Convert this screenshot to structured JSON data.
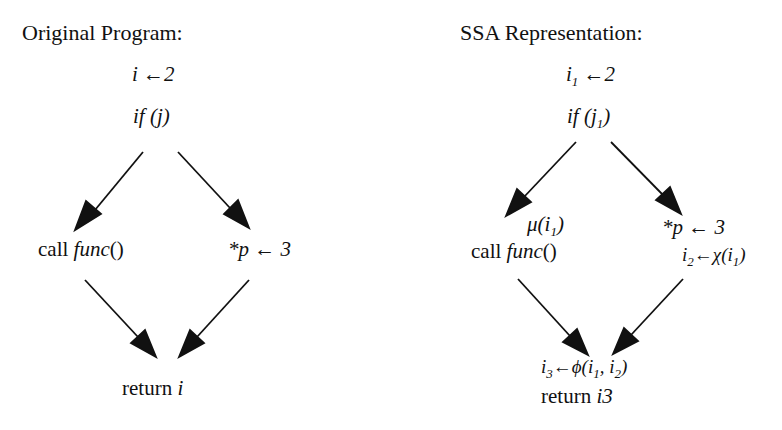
{
  "left": {
    "title": "Original Program:",
    "nodes": {
      "assign": {
        "var": "i",
        "arrow": " ←",
        "value": "2"
      },
      "cond": {
        "text": "if (j)"
      },
      "call": {
        "prefix": "call ",
        "func": "func",
        "suffix": "()"
      },
      "store": {
        "text": "*p",
        "arrow": " ← ",
        "value": "3"
      },
      "ret": {
        "prefix": "return ",
        "var": "i"
      }
    },
    "edges": [
      {
        "from": "cond",
        "to": "call"
      },
      {
        "from": "cond",
        "to": "store"
      },
      {
        "from": "call",
        "to": "ret"
      },
      {
        "from": "store",
        "to": "ret"
      }
    ]
  },
  "right": {
    "title": "SSA Representation:",
    "nodes": {
      "assign": {
        "var": "i",
        "sub": "1",
        "arrow": " ←",
        "value": "2"
      },
      "cond": {
        "pre": "if (j",
        "sub": "1",
        "post": ")"
      },
      "mu": {
        "pre": "μ(i",
        "sub": "1",
        "post": ")"
      },
      "call": {
        "prefix": "call ",
        "func": "func",
        "suffix": "()"
      },
      "store": {
        "text": "*p",
        "arrow": " ← ",
        "value": "3"
      },
      "chi": {
        "var": "i",
        "sub": "2",
        "op": "←χ(i",
        "sub2": "1",
        "post": ")"
      },
      "phi": {
        "var": "i",
        "sub": "3",
        "op": "←ϕ(i",
        "sub2": "1",
        "mid": ", i",
        "sub3": "2",
        "post": ")"
      },
      "ret": {
        "prefix": "return ",
        "var": "i3"
      }
    },
    "edges": [
      {
        "from": "cond",
        "to": "call"
      },
      {
        "from": "cond",
        "to": "store"
      },
      {
        "from": "call",
        "to": "phi"
      },
      {
        "from": "store",
        "to": "phi"
      }
    ]
  },
  "colors": {
    "ink": "#111111",
    "background": "#ffffff"
  }
}
